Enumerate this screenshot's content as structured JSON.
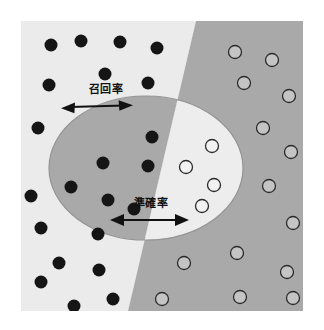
{
  "figure": {
    "canvas": {
      "width": 324,
      "height": 330,
      "background": "#ffffff"
    },
    "frame": {
      "x": 21,
      "y": 21,
      "width": 282,
      "height": 290
    },
    "colors": {
      "outer_left": "#ebebeb",
      "outer_right": "#a9a9a9",
      "ellipse_left": "#a9a9a9",
      "ellipse_right": "#ededed",
      "ellipse_stroke": "#8f8f8f",
      "dot_filled": "#151515",
      "dot_open_fill": "#c9c9c9",
      "dot_open_stroke": "#2b2b2b",
      "arrow": "#111111",
      "text": "#111111"
    },
    "divider": {
      "name": "classifier-decision-boundary",
      "top_x": 196,
      "bottom_x": 128
    },
    "ellipse": {
      "name": "retrieved-set-ellipse",
      "cx": 146,
      "cy": 168,
      "rx": 97,
      "ry": 72
    }
  },
  "labels": {
    "recall": {
      "text": "召回率",
      "x": 106,
      "y": 93
    },
    "precision": {
      "text": "準確率",
      "x": 151,
      "y": 207
    }
  },
  "arrows": {
    "recall": {
      "name": "recall-arrow",
      "x1": 62,
      "y1": 108,
      "x2": 131,
      "y2": 106
    },
    "precision": {
      "name": "precision-arrow",
      "x1": 111,
      "y1": 220,
      "x2": 188,
      "y2": 220
    }
  },
  "points": {
    "filled_label": "relevant-item-filled-dot",
    "open_label": "irrelevant-item-open-circle",
    "filled": [
      {
        "cx": 51,
        "cy": 45,
        "r": 6.5
      },
      {
        "cx": 81,
        "cy": 41,
        "r": 6.5
      },
      {
        "cx": 120,
        "cy": 42,
        "r": 6.5
      },
      {
        "cx": 157,
        "cy": 48,
        "r": 6.5
      },
      {
        "cx": 105,
        "cy": 74,
        "r": 6.5
      },
      {
        "cx": 49,
        "cy": 85,
        "r": 6.5
      },
      {
        "cx": 148,
        "cy": 83,
        "r": 6.5
      },
      {
        "cx": 38,
        "cy": 128,
        "r": 6.5
      },
      {
        "cx": 152,
        "cy": 137,
        "r": 6.5
      },
      {
        "cx": 103,
        "cy": 163,
        "r": 6.5
      },
      {
        "cx": 148,
        "cy": 166,
        "r": 6.5
      },
      {
        "cx": 71,
        "cy": 187,
        "r": 6.5
      },
      {
        "cx": 31,
        "cy": 196,
        "r": 6.5
      },
      {
        "cx": 108,
        "cy": 200,
        "r": 6.5
      },
      {
        "cx": 134,
        "cy": 209,
        "r": 6.5
      },
      {
        "cx": 41,
        "cy": 228,
        "r": 6.5
      },
      {
        "cx": 98,
        "cy": 234,
        "r": 6.5
      },
      {
        "cx": 59,
        "cy": 263,
        "r": 6.5
      },
      {
        "cx": 99,
        "cy": 270,
        "r": 6.5
      },
      {
        "cx": 41,
        "cy": 282,
        "r": 6.5
      },
      {
        "cx": 113,
        "cy": 299,
        "r": 6.5
      },
      {
        "cx": 74,
        "cy": 306,
        "r": 6.5
      }
    ],
    "open": [
      {
        "cx": 235,
        "cy": 52,
        "r": 6.5
      },
      {
        "cx": 272,
        "cy": 60,
        "r": 6.5
      },
      {
        "cx": 244,
        "cy": 83,
        "r": 6.5
      },
      {
        "cx": 289,
        "cy": 96,
        "r": 6.5
      },
      {
        "cx": 263,
        "cy": 128,
        "r": 6.5
      },
      {
        "cx": 212,
        "cy": 146,
        "r": 6.5
      },
      {
        "cx": 291,
        "cy": 152,
        "r": 6.5
      },
      {
        "cx": 186,
        "cy": 167,
        "r": 6.5
      },
      {
        "cx": 214,
        "cy": 185,
        "r": 6.5
      },
      {
        "cx": 269,
        "cy": 186,
        "r": 6.5
      },
      {
        "cx": 202,
        "cy": 206,
        "r": 6.5
      },
      {
        "cx": 293,
        "cy": 223,
        "r": 6.5
      },
      {
        "cx": 237,
        "cy": 253,
        "r": 6.5
      },
      {
        "cx": 184,
        "cy": 263,
        "r": 6.5
      },
      {
        "cx": 287,
        "cy": 272,
        "r": 6.5
      },
      {
        "cx": 240,
        "cy": 297,
        "r": 6.5
      },
      {
        "cx": 162,
        "cy": 299,
        "r": 6.5
      },
      {
        "cx": 293,
        "cy": 298,
        "r": 6.5
      }
    ]
  }
}
